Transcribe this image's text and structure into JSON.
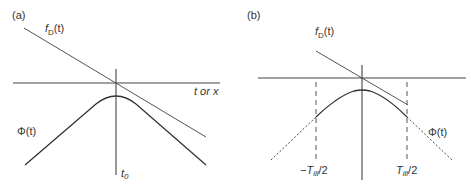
{
  "panels": [
    {
      "id": "a",
      "label": "(a)",
      "line_label": {
        "main": "f",
        "sub": "D",
        "arg": "(t)"
      },
      "axis_label": "t or x",
      "curve_label": {
        "main": "Φ",
        "arg": "(t)"
      },
      "vertical_label": {
        "main": "t",
        "sub": "0"
      }
    },
    {
      "id": "b",
      "label": "(b)",
      "line_label": {
        "main": "f",
        "sub": "D",
        "arg": "(t)"
      },
      "curve_label": {
        "main": "Φ",
        "arg": "(t)"
      },
      "left_marker": {
        "prefix": "−T",
        "sub": "ill",
        "suffix": "/2"
      },
      "right_marker": {
        "prefix": "T",
        "sub": "ill",
        "suffix": "/2"
      }
    }
  ],
  "colors": {
    "line": "#555555",
    "curve": "#333333",
    "axis": "#444444",
    "text": "#333333"
  }
}
